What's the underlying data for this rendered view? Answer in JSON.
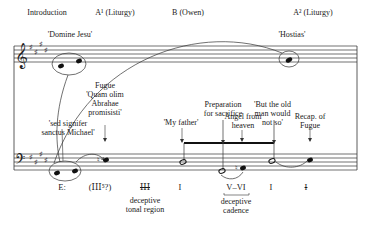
{
  "sections": [
    {
      "label": "Introduction",
      "x": 44
    },
    {
      "label": "A¹ (Liturgy)",
      "x": 107
    },
    {
      "label": "B (Owen)",
      "x": 184
    },
    {
      "label": "A² (Liturgy)",
      "x": 303
    }
  ],
  "annotations": {
    "domine_jesu": "'Domine Jesu'",
    "hostias": "'Hostias'",
    "fugue": [
      "Fugue",
      "'Quam olim",
      "Abrahae",
      "promisisti'"
    ],
    "sed_signifer": [
      "'sed signifer",
      "sanctus Michael'"
    ],
    "my_father": "'My father'",
    "preparation": [
      "Preparation",
      "for sacrifice"
    ],
    "but_the_old_man": [
      "'But the old",
      "man would",
      "not so'"
    ],
    "angel": [
      "Angel from",
      "heaven"
    ],
    "recap": [
      "Recap. of",
      "Fugue"
    ]
  },
  "harmony": {
    "key": "E:",
    "items": [
      {
        "label": "(ⅠⅠⅠ⁵?)",
        "x": 100
      },
      {
        "label": "ⅠⅠⅠ",
        "x": 145
      },
      {
        "label": "I",
        "x": 180
      },
      {
        "label": "V–VI",
        "x": 236
      },
      {
        "label": "I",
        "x": 271
      },
      {
        "label": "I",
        "x": 306
      }
    ],
    "deceptive_region": [
      "deceptive",
      "tonal region"
    ],
    "deceptive_cadence": [
      "deceptive",
      "cadence"
    ]
  },
  "staves": {
    "treble_clef": "𝄞",
    "bass_clef": "𝄢",
    "key_signature": "four sharps"
  }
}
